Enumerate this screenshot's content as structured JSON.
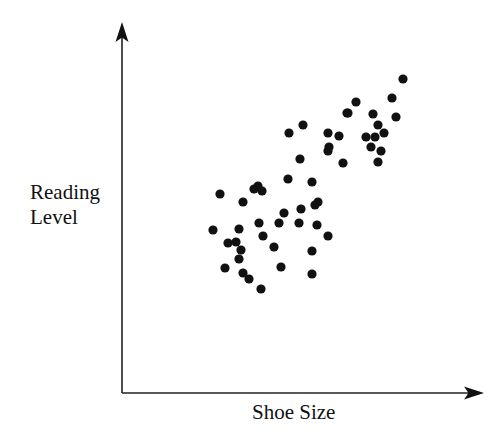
{
  "chart_data": {
    "type": "scatter",
    "title": "",
    "xlabel": "Shoe Size",
    "ylabel": [
      "Reading",
      "Level"
    ],
    "grid": false,
    "ticks": false,
    "legend": null,
    "xlim": [
      0,
      100
    ],
    "ylim": [
      0,
      100
    ],
    "note": "Unlabeled axes; values are normalized 0-100 positions within the axis box (x from y-axis, y from x-axis).",
    "points": [
      {
        "x": 25.3,
        "y": 54.5
      },
      {
        "x": 33.1,
        "y": 51.8
      },
      {
        "x": 36.5,
        "y": 55.6
      },
      {
        "x": 37.6,
        "y": 56.5
      },
      {
        "x": 38.7,
        "y": 55.0
      },
      {
        "x": 25.1,
        "y": 44.4
      },
      {
        "x": 32.2,
        "y": 44.7
      },
      {
        "x": 37.8,
        "y": 45.3
      },
      {
        "x": 29.3,
        "y": 40.8
      },
      {
        "x": 31.5,
        "y": 41.1
      },
      {
        "x": 32.9,
        "y": 38.7
      },
      {
        "x": 32.3,
        "y": 36.0
      },
      {
        "x": 28.7,
        "y": 33.9
      },
      {
        "x": 33.1,
        "y": 32.4
      },
      {
        "x": 34.8,
        "y": 30.6
      },
      {
        "x": 38.1,
        "y": 27.6
      },
      {
        "x": 39.2,
        "y": 41.1
      },
      {
        "x": 46.1,
        "y": 63.1
      },
      {
        "x": 52.8,
        "y": 62.2
      },
      {
        "x": 54.4,
        "y": 56.2
      },
      {
        "x": 53.6,
        "y": 55.3
      },
      {
        "x": 49.7,
        "y": 54.1
      },
      {
        "x": 44.8,
        "y": 52.9
      },
      {
        "x": 43.4,
        "y": 49.9
      },
      {
        "x": 48.9,
        "y": 49.9
      },
      {
        "x": 53.9,
        "y": 49.3
      },
      {
        "x": 56.9,
        "y": 46.0
      },
      {
        "x": 41.9,
        "y": 42.9
      },
      {
        "x": 52.5,
        "y": 41.7
      },
      {
        "x": 43.9,
        "y": 37.8
      },
      {
        "x": 52.5,
        "y": 35.7
      },
      {
        "x": 49.4,
        "y": 79.6
      },
      {
        "x": 45.6,
        "y": 77.2
      },
      {
        "x": 56.4,
        "y": 77.2
      },
      {
        "x": 59.4,
        "y": 76.3
      },
      {
        "x": 56.7,
        "y": 73.0
      },
      {
        "x": 56.4,
        "y": 71.8
      },
      {
        "x": 49.2,
        "y": 69.1
      },
      {
        "x": 61.3,
        "y": 68.8
      },
      {
        "x": 62.4,
        "y": 82.9
      },
      {
        "x": 77.6,
        "y": 93.7
      },
      {
        "x": 74.6,
        "y": 88.0
      },
      {
        "x": 64.6,
        "y": 86.8
      },
      {
        "x": 69.6,
        "y": 82.6
      },
      {
        "x": 75.7,
        "y": 81.7
      },
      {
        "x": 70.7,
        "y": 80.5
      },
      {
        "x": 72.4,
        "y": 77.2
      },
      {
        "x": 67.4,
        "y": 76.0
      },
      {
        "x": 69.9,
        "y": 76.0
      },
      {
        "x": 68.8,
        "y": 73.0
      },
      {
        "x": 71.5,
        "y": 71.8
      },
      {
        "x": 70.7,
        "y": 68.5
      },
      {
        "x": 61.3,
        "y": 68.5
      }
    ],
    "pixel_points": [
      [
        220,
        194
      ],
      [
        243,
        202
      ],
      [
        254,
        189
      ],
      [
        258,
        186
      ],
      [
        262,
        191
      ],
      [
        213,
        230
      ],
      [
        239,
        229
      ],
      [
        259,
        223
      ],
      [
        228,
        243
      ],
      [
        236,
        242
      ],
      [
        241,
        250
      ],
      [
        239,
        259
      ],
      [
        225,
        268
      ],
      [
        243,
        273
      ],
      [
        249,
        279
      ],
      [
        261,
        289
      ],
      [
        263,
        236
      ],
      [
        288,
        179
      ],
      [
        312,
        182
      ],
      [
        318,
        202
      ],
      [
        315,
        205
      ],
      [
        301,
        209
      ],
      [
        284,
        213
      ],
      [
        279,
        223
      ],
      [
        299,
        223
      ],
      [
        317,
        225
      ],
      [
        328,
        236
      ],
      [
        274,
        247
      ],
      [
        312,
        251
      ],
      [
        281,
        267
      ],
      [
        312,
        274
      ],
      [
        303,
        125
      ],
      [
        289,
        133
      ],
      [
        328,
        133
      ],
      [
        339,
        136
      ],
      [
        329,
        147
      ],
      [
        328,
        151
      ],
      [
        300,
        159
      ],
      [
        343,
        163
      ],
      [
        347,
        113
      ],
      [
        403,
        79
      ],
      [
        392,
        98
      ],
      [
        356,
        102
      ],
      [
        348,
        113
      ],
      [
        373,
        114
      ],
      [
        396,
        117
      ],
      [
        378,
        125
      ],
      [
        384,
        133
      ],
      [
        366,
        137
      ],
      [
        375,
        137
      ],
      [
        371,
        147
      ],
      [
        381,
        151
      ],
      [
        378,
        162
      ]
    ],
    "layout": {
      "origin": [
        122,
        393
      ],
      "y_axis_top": 22,
      "x_axis_right": 484,
      "marker_radius": 4.6,
      "marker_color": "#111111",
      "axis_color": "#222222"
    }
  }
}
